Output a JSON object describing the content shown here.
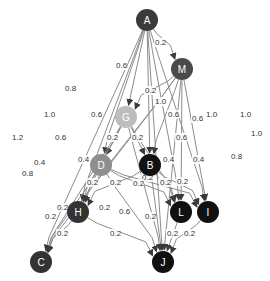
{
  "diagram": {
    "type": "directed-weighted-graph",
    "nodes": [
      {
        "id": "A",
        "label": "A",
        "x": 147,
        "y": 20,
        "color": "#3b3b3b"
      },
      {
        "id": "M",
        "label": "M",
        "x": 182,
        "y": 69,
        "color": "#4a4a4a"
      },
      {
        "id": "G",
        "label": "G",
        "x": 126,
        "y": 117,
        "color": "#bdbdbd"
      },
      {
        "id": "D",
        "label": "D",
        "x": 101,
        "y": 165,
        "color": "#8e8e8e"
      },
      {
        "id": "B",
        "label": "B",
        "x": 150,
        "y": 165,
        "color": "#111111"
      },
      {
        "id": "H",
        "label": "H",
        "x": 78,
        "y": 212,
        "color": "#333333"
      },
      {
        "id": "L",
        "label": "L",
        "x": 181,
        "y": 212,
        "color": "#111111"
      },
      {
        "id": "I",
        "label": "I",
        "x": 208,
        "y": 212,
        "color": "#111111"
      },
      {
        "id": "C",
        "label": "C",
        "x": 41,
        "y": 262,
        "color": "#333333"
      },
      {
        "id": "J",
        "label": "J",
        "x": 163,
        "y": 262,
        "color": "#111111"
      }
    ],
    "edge_labels": [
      {
        "text": "0.2",
        "x": 155,
        "y": 45
      },
      {
        "text": "0.6",
        "x": 116,
        "y": 68
      },
      {
        "text": "0.8",
        "x": 65,
        "y": 91
      },
      {
        "text": "0.2",
        "x": 145,
        "y": 93
      },
      {
        "text": "1.0",
        "x": 155,
        "y": 104
      },
      {
        "text": "1.0",
        "x": 44,
        "y": 117
      },
      {
        "text": "0.6",
        "x": 91,
        "y": 117
      },
      {
        "text": "0.6",
        "x": 168,
        "y": 117
      },
      {
        "text": "0.6",
        "x": 192,
        "y": 121
      },
      {
        "text": "1.0",
        "x": 206,
        "y": 117
      },
      {
        "text": "1.0",
        "x": 240,
        "y": 117
      },
      {
        "text": "1.2",
        "x": 12,
        "y": 140
      },
      {
        "text": "0.6",
        "x": 55,
        "y": 140
      },
      {
        "text": "0.2",
        "x": 107,
        "y": 140
      },
      {
        "text": "0.2",
        "x": 132,
        "y": 140
      },
      {
        "text": "0.6",
        "x": 176,
        "y": 140
      },
      {
        "text": "1.0",
        "x": 251,
        "y": 136
      },
      {
        "text": "0.4",
        "x": 34,
        "y": 165
      },
      {
        "text": "0.4",
        "x": 78,
        "y": 162
      },
      {
        "text": "0.4",
        "x": 163,
        "y": 162
      },
      {
        "text": "0.4",
        "x": 193,
        "y": 162
      },
      {
        "text": "0.8",
        "x": 231,
        "y": 159
      },
      {
        "text": "0.8",
        "x": 22,
        "y": 176
      },
      {
        "text": "0.2",
        "x": 87,
        "y": 185
      },
      {
        "text": "0.2",
        "x": 110,
        "y": 185
      },
      {
        "text": "0.2",
        "x": 142,
        "y": 180
      },
      {
        "text": "0.2",
        "x": 133,
        "y": 186
      },
      {
        "text": "0.2",
        "x": 160,
        "y": 185
      },
      {
        "text": "0.2",
        "x": 177,
        "y": 184
      },
      {
        "text": "0.2",
        "x": 57,
        "y": 210
      },
      {
        "text": "0.2",
        "x": 45,
        "y": 219
      },
      {
        "text": "0.2",
        "x": 99,
        "y": 210
      },
      {
        "text": "0.6",
        "x": 119,
        "y": 214
      },
      {
        "text": "0.2",
        "x": 145,
        "y": 219
      },
      {
        "text": "0.2",
        "x": 57,
        "y": 236
      },
      {
        "text": "0.2",
        "x": 110,
        "y": 236
      },
      {
        "text": "0.2",
        "x": 167,
        "y": 236
      },
      {
        "text": "0.2",
        "x": 184,
        "y": 236
      }
    ],
    "edges": [
      {
        "from": "A",
        "to": "M",
        "weight": "0.2"
      },
      {
        "from": "A",
        "to": "G",
        "weight": "0.6"
      },
      {
        "from": "A",
        "to": "D",
        "weight": "0.8"
      },
      {
        "from": "A",
        "to": "H",
        "weight": "1.0"
      },
      {
        "from": "A",
        "to": "C",
        "weight": "1.2"
      },
      {
        "from": "A",
        "to": "B",
        "weight": "0.6"
      },
      {
        "from": "A",
        "to": "L",
        "weight": "1.0"
      },
      {
        "from": "A",
        "to": "I",
        "weight": "1.0"
      },
      {
        "from": "A",
        "to": "J",
        "weight": "1.0"
      },
      {
        "from": "M",
        "to": "G",
        "weight": "0.2"
      },
      {
        "from": "M",
        "to": "B",
        "weight": "1.0"
      },
      {
        "from": "M",
        "to": "C",
        "weight": "0.8"
      },
      {
        "from": "M",
        "to": "H",
        "weight": "0.6"
      },
      {
        "from": "M",
        "to": "L",
        "weight": "0.6"
      },
      {
        "from": "M",
        "to": "I",
        "weight": "0.6"
      },
      {
        "from": "M",
        "to": "J",
        "weight": "0.8"
      },
      {
        "from": "G",
        "to": "D",
        "weight": "0.2"
      },
      {
        "from": "G",
        "to": "B",
        "weight": "0.2"
      },
      {
        "from": "G",
        "to": "C",
        "weight": "0.4"
      },
      {
        "from": "G",
        "to": "H",
        "weight": "0.4"
      },
      {
        "from": "G",
        "to": "L",
        "weight": "0.4"
      },
      {
        "from": "G",
        "to": "J",
        "weight": "0.6"
      },
      {
        "from": "D",
        "to": "H",
        "weight": "0.2"
      },
      {
        "from": "D",
        "to": "C",
        "weight": "0.2"
      },
      {
        "from": "D",
        "to": "L",
        "weight": "0.2"
      },
      {
        "from": "D",
        "to": "I",
        "weight": "0.2"
      },
      {
        "from": "D",
        "to": "J",
        "weight": "0.2"
      },
      {
        "from": "B",
        "to": "H",
        "weight": "0.2"
      },
      {
        "from": "B",
        "to": "L",
        "weight": "0.2"
      },
      {
        "from": "B",
        "to": "I",
        "weight": "0.2"
      },
      {
        "from": "B",
        "to": "J",
        "weight": "0.2"
      },
      {
        "from": "H",
        "to": "C",
        "weight": "0.2"
      },
      {
        "from": "H",
        "to": "J",
        "weight": "0.2"
      },
      {
        "from": "L",
        "to": "J",
        "weight": "0.2"
      },
      {
        "from": "I",
        "to": "J",
        "weight": "0.2"
      }
    ]
  }
}
